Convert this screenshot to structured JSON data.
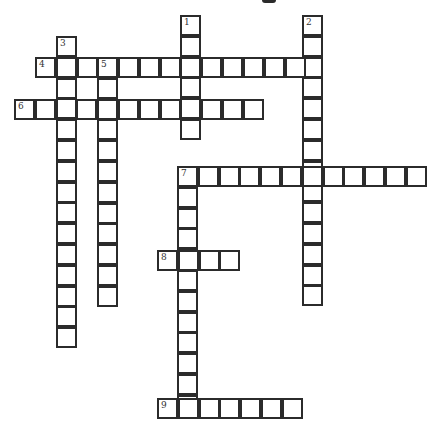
{
  "puzzle": {
    "type": "crossword",
    "cell_px": 20.8,
    "origin": {
      "x": 14,
      "y": 15
    },
    "clues": [
      {
        "number": "1",
        "direction": "down",
        "x": 180,
        "y": 15,
        "length": 6
      },
      {
        "number": "2",
        "direction": "down",
        "x": 302,
        "y": 15,
        "length": 14
      },
      {
        "number": "3",
        "direction": "down",
        "x": 56,
        "y": 36,
        "length": 15
      },
      {
        "number": "4",
        "direction": "across",
        "x": 35,
        "y": 57,
        "length": 14
      },
      {
        "number": "5",
        "direction": "down",
        "x": 97,
        "y": 57,
        "length": 12
      },
      {
        "number": "6",
        "direction": "across",
        "x": 14,
        "y": 99,
        "length": 12
      },
      {
        "number": "7",
        "direction": "across",
        "x": 177,
        "y": 166,
        "length": 12
      },
      {
        "number": "7d",
        "label": "",
        "direction": "down",
        "x": 177,
        "y": 166,
        "length": 12
      },
      {
        "number": "8",
        "direction": "across",
        "x": 157,
        "y": 250,
        "length": 4
      },
      {
        "number": "9",
        "direction": "across",
        "x": 157,
        "y": 398,
        "length": 7
      }
    ]
  }
}
